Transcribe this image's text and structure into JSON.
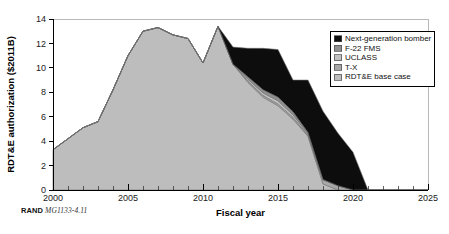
{
  "caption": {
    "publisher": "RAND",
    "document_id": "MG1133-4.11"
  },
  "legend": {
    "position": "top-right",
    "items": [
      {
        "label": "Next-generation bomber",
        "color": "#0d0d0d"
      },
      {
        "label": "F-22 FMS",
        "color": "#8f8f8f"
      },
      {
        "label": "UCLASS",
        "color": "#c2c2c2"
      },
      {
        "label": "T-X",
        "color": "#a8a8a8"
      },
      {
        "label": "RDT&E base case",
        "color": "#bdbdbd"
      }
    ]
  },
  "chart_data": {
    "type": "area",
    "stacked": true,
    "title": "",
    "xlabel": "Fiscal year",
    "ylabel": "RDT&E authorization ($2011B)",
    "xlim": [
      2000,
      2025
    ],
    "ylim": [
      0,
      14
    ],
    "xticks": [
      2000,
      2005,
      2010,
      2015,
      2020,
      2025
    ],
    "yticks": [
      0,
      2,
      4,
      6,
      8,
      10,
      12,
      14
    ],
    "minor_xtick_interval": 1,
    "grid": false,
    "x": [
      2000,
      2001,
      2002,
      2003,
      2004,
      2005,
      2006,
      2007,
      2008,
      2009,
      2010,
      2011,
      2012,
      2013,
      2014,
      2015,
      2016,
      2017,
      2018,
      2019,
      2020,
      2021,
      2022,
      2023,
      2024,
      2025
    ],
    "series": [
      {
        "name": "RDT&E base case",
        "color": "#bdbdbd",
        "values": [
          3.3,
          4.2,
          5.1,
          5.6,
          8.2,
          11.0,
          13.0,
          13.3,
          12.7,
          12.4,
          10.4,
          13.4,
          10.3,
          8.8,
          7.6,
          6.9,
          5.8,
          4.4,
          0.5,
          0.0,
          0.0,
          0.0,
          0.0,
          0.0,
          0.0,
          0.0
        ]
      },
      {
        "name": "T-X",
        "color": "#a8a8a8",
        "values": [
          0.0,
          0.0,
          0.0,
          0.0,
          0.0,
          0.0,
          0.0,
          0.0,
          0.0,
          0.0,
          0.0,
          0.0,
          0.0,
          0.1,
          0.15,
          0.15,
          0.15,
          0.1,
          0.35,
          0.35,
          0.0,
          0.0,
          0.0,
          0.0,
          0.0,
          0.0
        ]
      },
      {
        "name": "UCLASS",
        "color": "#c2c2c2",
        "values": [
          0.0,
          0.0,
          0.0,
          0.0,
          0.0,
          0.0,
          0.0,
          0.0,
          0.0,
          0.0,
          0.0,
          0.0,
          0.0,
          0.15,
          0.2,
          0.25,
          0.2,
          0.1,
          0.0,
          0.0,
          0.0,
          0.0,
          0.0,
          0.0,
          0.0,
          0.0
        ]
      },
      {
        "name": "F-22 FMS",
        "color": "#8f8f8f",
        "values": [
          0.0,
          0.0,
          0.0,
          0.0,
          0.0,
          0.0,
          0.0,
          0.0,
          0.0,
          0.0,
          0.0,
          0.0,
          0.0,
          0.2,
          0.25,
          0.3,
          0.25,
          0.1,
          0.0,
          0.0,
          0.0,
          0.0,
          0.0,
          0.0,
          0.0,
          0.0
        ]
      },
      {
        "name": "Next-generation bomber",
        "color": "#0d0d0d",
        "values": [
          0.0,
          0.0,
          0.0,
          0.0,
          0.0,
          0.0,
          0.0,
          0.0,
          0.0,
          0.0,
          0.0,
          0.0,
          1.4,
          2.35,
          3.4,
          3.9,
          2.6,
          4.3,
          5.6,
          4.3,
          3.1,
          0.0,
          0.0,
          0.0,
          0.0,
          0.0
        ]
      }
    ]
  }
}
